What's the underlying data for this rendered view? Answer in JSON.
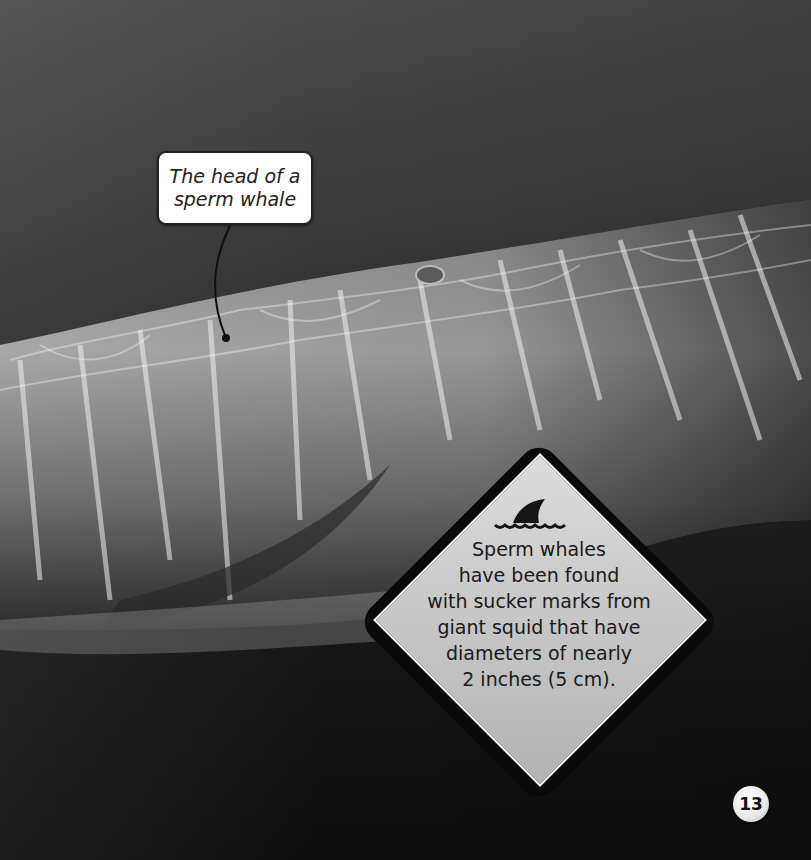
{
  "photo": {
    "subject": "sperm whale head underwater with light ripple patterns",
    "background_top": "#4a4a4a",
    "background_bottom": "#0e0e0e"
  },
  "callout": {
    "text": "The head of a\nsperm whale"
  },
  "fact_box": {
    "icon": "shark-fin-icon",
    "text": "Sperm whales\nhave been found\nwith sucker marks from\ngiant squid that have\ndiameters of nearly\n2 inches (5 cm)."
  },
  "page_number": "13"
}
